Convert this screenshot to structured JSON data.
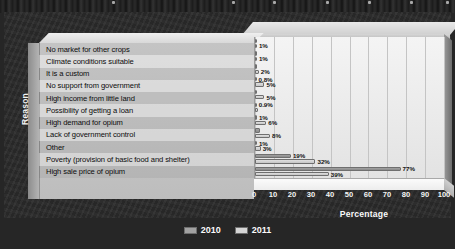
{
  "chart_data": {
    "type": "bar",
    "orientation": "horizontal",
    "title": "",
    "xlabel": "Percentage",
    "ylabel": "Reason",
    "xlim": [
      0,
      100
    ],
    "xticks": [
      "0",
      "10",
      "20",
      "30",
      "40",
      "50",
      "60",
      "70",
      "80",
      "90",
      "100"
    ],
    "grid": true,
    "legend_position": "bottom",
    "categories": [
      "No market for other crops",
      "Climate conditions suitable",
      "It is a custom",
      "No support from government",
      "High income from little land",
      "Possibility of getting a loan",
      "High demand for opium",
      "Lack of government control",
      "Other",
      "Poverty (provision of basic food and shelter)",
      "High sale price of opium"
    ],
    "series": [
      {
        "name": "2010",
        "values": [
          0.5,
          0.5,
          0.6,
          0.8,
          1.2,
          0.9,
          1.0,
          2.5,
          1.0,
          19,
          77
        ],
        "labels": [
          "",
          "",
          "",
          "0.8%",
          "",
          "0.9%",
          "1%",
          "",
          "1%",
          "19%",
          "77%"
        ]
      },
      {
        "name": "2011",
        "values": [
          1,
          1,
          2,
          5,
          5,
          1.5,
          6,
          8,
          3,
          32,
          39
        ],
        "labels": [
          "1%",
          "1%",
          "2%",
          "5%",
          "5%",
          "",
          "6%",
          "8%",
          "3%",
          "32%",
          "39%"
        ]
      }
    ]
  },
  "legend": {
    "items": [
      {
        "label": "2010",
        "color": "#a2a2a2"
      },
      {
        "label": "2011",
        "color": "#d5d5d5"
      }
    ]
  },
  "axes": {
    "y_title": "Reason",
    "x_title": "Percentage"
  }
}
